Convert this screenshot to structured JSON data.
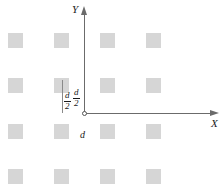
{
  "figure": {
    "type": "schematic-diagram",
    "background_color": "#ffffff",
    "element_color": "#d6d6d6",
    "axis_color": "#6b6b6b",
    "text_color": "#1a1a1a"
  },
  "axes": {
    "x": {
      "label": "X",
      "origin_px": [
        84,
        113
      ],
      "end_px": [
        210,
        113
      ],
      "arrow": "right"
    },
    "y": {
      "label": "Y",
      "origin_px": [
        84,
        113
      ],
      "end_px": [
        84,
        14
      ],
      "arrow": "up"
    },
    "origin_marker": "open-circle"
  },
  "labels": {
    "x_axis": "X",
    "y_axis": "Y",
    "period": "d",
    "half_period_horizontal": {
      "numerator": "d",
      "denominator": "2"
    },
    "half_period_vertical": {
      "numerator": "d",
      "denominator": "2"
    }
  },
  "lattice": {
    "rows": 4,
    "columns": 4,
    "square_size_px": 15,
    "column_x_px": [
      8,
      54,
      100,
      146
    ],
    "row_y_px": [
      33,
      78,
      124,
      169
    ],
    "pitch_x_px": 46,
    "pitch_y_px": 45,
    "squares": [
      {
        "row": 0,
        "col": 0,
        "x": 8,
        "y": 33
      },
      {
        "row": 0,
        "col": 1,
        "x": 54,
        "y": 33
      },
      {
        "row": 0,
        "col": 2,
        "x": 100,
        "y": 33
      },
      {
        "row": 0,
        "col": 3,
        "x": 146,
        "y": 33
      },
      {
        "row": 1,
        "col": 0,
        "x": 8,
        "y": 78
      },
      {
        "row": 1,
        "col": 1,
        "x": 54,
        "y": 78
      },
      {
        "row": 1,
        "col": 2,
        "x": 100,
        "y": 78
      },
      {
        "row": 1,
        "col": 3,
        "x": 146,
        "y": 78
      },
      {
        "row": 2,
        "col": 0,
        "x": 8,
        "y": 124
      },
      {
        "row": 2,
        "col": 1,
        "x": 54,
        "y": 124
      },
      {
        "row": 2,
        "col": 2,
        "x": 100,
        "y": 124
      },
      {
        "row": 2,
        "col": 3,
        "x": 146,
        "y": 124
      },
      {
        "row": 3,
        "col": 0,
        "x": 8,
        "y": 169
      },
      {
        "row": 3,
        "col": 1,
        "x": 54,
        "y": 169
      },
      {
        "row": 3,
        "col": 2,
        "x": 100,
        "y": 169
      },
      {
        "row": 3,
        "col": 3,
        "x": 146,
        "y": 169
      }
    ]
  },
  "dimension_lines": {
    "vertical_tick": {
      "x": 62,
      "y_top": 80,
      "y_bottom": 113
    }
  }
}
